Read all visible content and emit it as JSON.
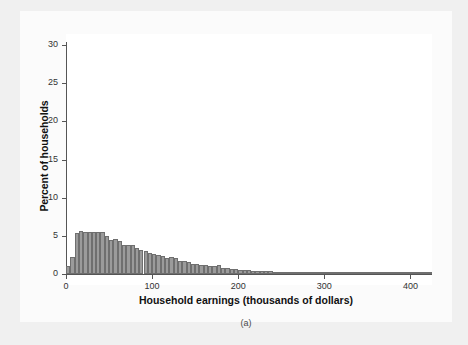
{
  "figure": {
    "caption": "(a)",
    "background_color": "#f0f0f0",
    "panel_color": "#fbfbfb",
    "plot_color": "#ffffff"
  },
  "chart_data": {
    "type": "bar",
    "title": "",
    "subtitle": "",
    "xlabel": "Household earnings (thousands of dollars)",
    "ylabel": "Percent of households",
    "xlim": [
      0,
      425
    ],
    "ylim": [
      0,
      31
    ],
    "xticks": [
      0,
      100,
      200,
      300,
      400
    ],
    "yticks": [
      0,
      5,
      10,
      15,
      20,
      25,
      30
    ],
    "xtick_labels": [
      "0",
      "100",
      "200",
      "300",
      "400"
    ],
    "ytick_labels": [
      "0",
      "5",
      "10",
      "15",
      "20",
      "25",
      "30"
    ],
    "grid": false,
    "legend": false,
    "bar_color": "#9b9b9b",
    "bar_edge_color": "#6f6f6f",
    "bin_width": 5,
    "bin_starts": [
      0,
      5,
      10,
      15,
      20,
      25,
      30,
      35,
      40,
      45,
      50,
      55,
      60,
      65,
      70,
      75,
      80,
      85,
      90,
      95,
      100,
      105,
      110,
      115,
      120,
      125,
      130,
      135,
      140,
      145,
      150,
      155,
      160,
      165,
      170,
      175,
      180,
      185,
      190,
      195,
      200,
      205,
      210,
      215,
      220,
      225,
      230,
      235,
      240,
      245,
      250,
      255,
      260,
      265,
      270,
      275,
      280,
      285,
      290,
      295,
      300,
      305,
      310,
      315,
      320,
      325,
      330,
      335,
      340,
      345,
      350,
      355,
      360,
      365,
      370,
      375,
      380,
      385,
      390,
      395,
      400,
      405,
      410,
      415,
      420
    ],
    "values": [
      1.0,
      2.25,
      5.35,
      5.6,
      5.5,
      5.5,
      5.45,
      5.5,
      5.45,
      4.95,
      4.5,
      4.65,
      4.3,
      3.85,
      3.85,
      3.75,
      3.4,
      3.2,
      3.05,
      2.8,
      2.6,
      2.55,
      2.35,
      2.1,
      2.2,
      2.15,
      1.75,
      1.7,
      1.6,
      1.35,
      1.3,
      1.15,
      1.15,
      1.1,
      1.05,
      1.15,
      0.85,
      0.8,
      0.65,
      0.65,
      0.55,
      0.5,
      0.5,
      0.45,
      0.45,
      0.4,
      0.35,
      0.35,
      0.3,
      0.3,
      0.3,
      0.25,
      0.25,
      0.25,
      0.2,
      0.2,
      0.2,
      0.2,
      0.18,
      0.18,
      0.16,
      0.16,
      0.15,
      0.15,
      0.14,
      0.12,
      0.12,
      0.12,
      0.1,
      0.1,
      0.1,
      0.1,
      0.1,
      0.08,
      0.08,
      0.08,
      0.08,
      0.08,
      0.06,
      0.06,
      0.06,
      0.05,
      0.05,
      0.05,
      0.05
    ]
  }
}
